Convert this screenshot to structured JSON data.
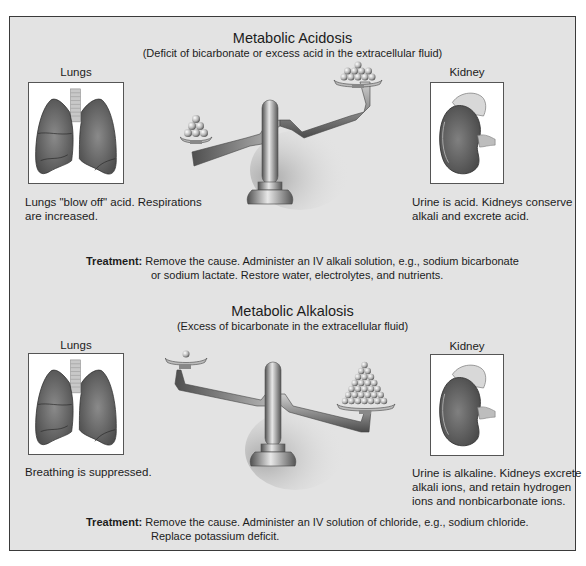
{
  "acidosis": {
    "title": "Metabolic Acidosis",
    "subtitle": "(Deficit of bicarbonate or excess acid in the extracellular fluid)",
    "lungs": {
      "label": "Lungs",
      "description_line1": "Lungs \"blow off\" acid. Respirations",
      "description_line2": "are increased."
    },
    "kidney": {
      "label": "Kidney",
      "description_line1": "Urine is acid. Kidneys conserve",
      "description_line2": "alkali and excrete acid."
    },
    "scale": {
      "heavier_side": "left",
      "left_balls": 6,
      "right_balls": 10
    },
    "treatment": {
      "label": "Treatment:",
      "line1": "Remove the cause. Administer an IV alkali solution, e.g., sodium bicarbonate",
      "line2": "or sodium lactate. Restore water, electrolytes, and nutrients."
    }
  },
  "alkalosis": {
    "title": "Metabolic Alkalosis",
    "subtitle": "(Excess of bicarbonate in the extracellular fluid)",
    "lungs": {
      "label": "Lungs",
      "description_line1": "Breathing is suppressed."
    },
    "kidney": {
      "label": "Kidney",
      "description_line1": "Urine is alkaline. Kidneys excrete",
      "description_line2": "alkali ions, and retain hydrogen",
      "description_line3": "ions and nonbicarbonate ions."
    },
    "scale": {
      "heavier_side": "right",
      "left_balls": 1,
      "right_balls": 28
    },
    "treatment": {
      "label": "Treatment:",
      "line1": "Remove the cause. Administer an IV solution of chloride, e.g., sodium chloride.",
      "line2": "Replace potassium deficit."
    }
  },
  "colors": {
    "panel_background": "#e3e3e3",
    "frame_border": "#3a3a3a",
    "organ_fill": "#6e6e6e",
    "metal_light": "#d0d0d0",
    "metal_dark": "#5a5a5a"
  }
}
